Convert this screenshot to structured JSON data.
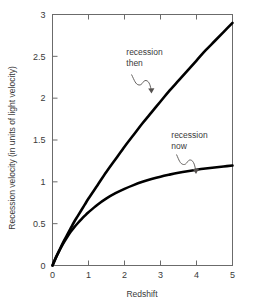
{
  "chart_data": {
    "type": "line",
    "title": "",
    "xlabel": "Redshift",
    "ylabel": "Recession velocity (in units of light velocity)",
    "xlim": [
      0,
      5
    ],
    "ylim": [
      0,
      3
    ],
    "xticks": [
      "0",
      "1",
      "2",
      "3",
      "4",
      "5"
    ],
    "xtick_values": [
      0,
      1,
      2,
      3,
      4,
      5
    ],
    "yticks": [
      "0",
      "0.5",
      "1",
      "1.5",
      "2",
      "2.5",
      "3"
    ],
    "ytick_values": [
      0,
      0.5,
      1,
      1.5,
      2,
      2.5,
      3
    ],
    "grid": false,
    "legend": "none",
    "annotations": [
      {
        "name": "recession-then",
        "line1": "recession",
        "line2": "then",
        "x": 2.05,
        "y": 2.52
      },
      {
        "name": "recession-now",
        "line1": "recession",
        "line2": "now",
        "x": 3.3,
        "y": 1.52
      }
    ],
    "series": [
      {
        "name": "recession then",
        "x": [
          0,
          0.1,
          0.2,
          0.3,
          0.4,
          0.5,
          0.6,
          0.7,
          0.8,
          0.9,
          1.0,
          1.25,
          1.5,
          1.75,
          2.0,
          2.25,
          2.5,
          2.75,
          3.0,
          3.25,
          3.5,
          3.75,
          4.0,
          4.25,
          4.5,
          4.75,
          5.0
        ],
        "values": [
          0,
          0.1,
          0.19,
          0.28,
          0.36,
          0.44,
          0.52,
          0.59,
          0.66,
          0.73,
          0.8,
          0.96,
          1.12,
          1.27,
          1.42,
          1.56,
          1.7,
          1.83,
          1.96,
          2.09,
          2.21,
          2.33,
          2.45,
          2.57,
          2.68,
          2.79,
          2.9
        ]
      },
      {
        "name": "recession now",
        "x": [
          0,
          0.1,
          0.2,
          0.3,
          0.4,
          0.5,
          0.6,
          0.7,
          0.8,
          0.9,
          1.0,
          1.25,
          1.5,
          1.75,
          2.0,
          2.25,
          2.5,
          2.75,
          3.0,
          3.25,
          3.5,
          3.75,
          4.0,
          4.25,
          4.5,
          4.75,
          5.0
        ],
        "values": [
          0,
          0.1,
          0.185,
          0.265,
          0.335,
          0.4,
          0.455,
          0.505,
          0.552,
          0.596,
          0.637,
          0.727,
          0.802,
          0.864,
          0.916,
          0.961,
          1.0,
          1.033,
          1.062,
          1.086,
          1.108,
          1.127,
          1.144,
          1.159,
          1.172,
          1.184,
          1.195
        ]
      }
    ]
  },
  "style": {
    "curve_stroke": "#000000",
    "frame_stroke": "#6b6b6b",
    "text_color": "#3a3a3a",
    "background": "#ffffff",
    "curve_width": "2.6"
  }
}
